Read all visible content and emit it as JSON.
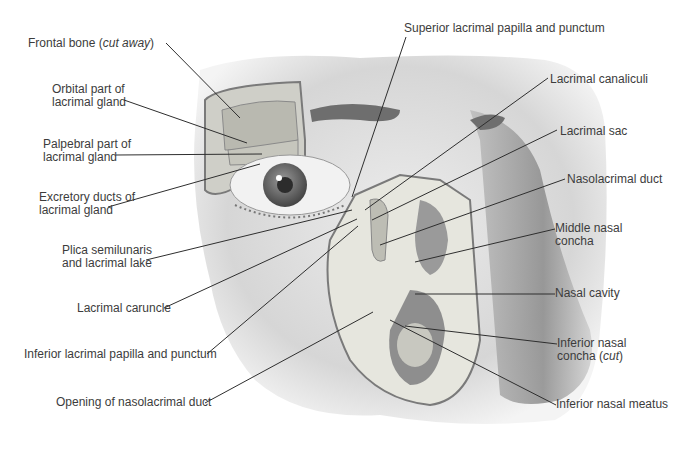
{
  "diagram": {
    "colors": {
      "ink": "#3c3c3c",
      "skin": "#d9d9d9",
      "shadow": "#8a8a8a",
      "bone": "#e8e8e0",
      "background": "#ffffff"
    },
    "labels_left": [
      {
        "id": "frontal-bone",
        "line1": "Frontal bone (",
        "italic": "cut away",
        "line1_end": ")"
      },
      {
        "id": "orbital-part",
        "line1": "Orbital part of",
        "line2": "lacrimal gland"
      },
      {
        "id": "palpebral-part",
        "line1": "Palpebral part of",
        "line2": "lacrimal gland"
      },
      {
        "id": "excretory-ducts",
        "line1": "Excretory ducts of",
        "line2": "lacrimal gland"
      },
      {
        "id": "plica",
        "line1": "Plica semilunaris",
        "line2": "and lacrimal lake"
      },
      {
        "id": "caruncle",
        "line1": "Lacrimal caruncle"
      },
      {
        "id": "inferior-papilla",
        "line1": "Inferior lacrimal papilla and punctum"
      },
      {
        "id": "opening-duct",
        "line1": "Opening of nasolacrimal duct"
      }
    ],
    "labels_right": [
      {
        "id": "superior-papilla",
        "line1": "Superior lacrimal papilla and punctum"
      },
      {
        "id": "canaliculi",
        "line1": "Lacrimal canaliculi"
      },
      {
        "id": "sac",
        "line1": "Lacrimal sac"
      },
      {
        "id": "nasolacrimal-duct",
        "line1": "Nasolacrimal duct"
      },
      {
        "id": "middle-concha",
        "line1": "Middle nasal",
        "line2": "concha"
      },
      {
        "id": "nasal-cavity",
        "line1": "Nasal cavity"
      },
      {
        "id": "inferior-concha",
        "line1": "Inferior nasal",
        "line2a": "concha (",
        "italic": "cut",
        "line2_end": ")"
      },
      {
        "id": "inferior-meatus",
        "line1": "Inferior nasal meatus"
      }
    ]
  }
}
